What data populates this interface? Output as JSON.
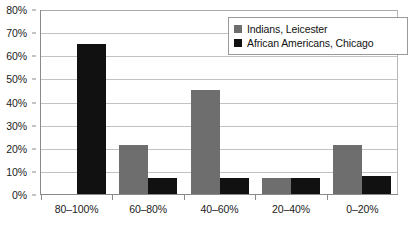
{
  "chart_data": {
    "type": "bar",
    "title": "",
    "xlabel": "",
    "ylabel": "",
    "ylim": [
      0,
      80
    ],
    "grid": true,
    "legend_position": "top-right",
    "categories": [
      "80–100%",
      "60–80%",
      "40–60%",
      "20–40%",
      "0–20%"
    ],
    "ytick_labels": [
      "80%",
      "70%",
      "60%",
      "50%",
      "40%",
      "30%",
      "20%",
      "10%",
      "0%"
    ],
    "ytick_values": [
      80,
      70,
      60,
      50,
      40,
      30,
      20,
      10,
      0
    ],
    "series": [
      {
        "name": "Indians, Leicester",
        "color": "#6e6e6e",
        "values": [
          0,
          21,
          45,
          7,
          21
        ]
      },
      {
        "name": "African Americans, Chicago",
        "color": "#111111",
        "values": [
          65,
          7,
          7,
          7,
          8
        ]
      }
    ]
  },
  "colors": {
    "series_gray": "#6e6e6e",
    "series_black": "#111111",
    "gridline": "#c2c2c2",
    "axis": "#8a8a8a",
    "background": "#ffffff",
    "legend_border": "#9a9a9a"
  }
}
